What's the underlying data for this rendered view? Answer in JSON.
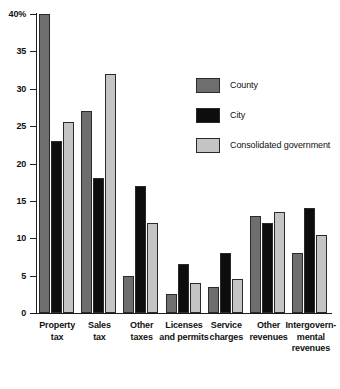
{
  "chart_data": {
    "type": "bar",
    "title": "",
    "subtitle": "",
    "xlabel": "",
    "ylabel": "",
    "ylim": [
      0,
      40
    ],
    "grid": false,
    "legend_position": "upper-right-inside",
    "y_ticks": [
      "0",
      "5",
      "10",
      "15",
      "20",
      "25",
      "30",
      "35",
      "40%"
    ],
    "y_tick_values": [
      0,
      5,
      10,
      15,
      20,
      25,
      30,
      35,
      40
    ],
    "categories": [
      "Property tax",
      "Sales tax",
      "Other taxes",
      "Licenses and permits",
      "Service charges",
      "Other revenues",
      "Intergovernmental revenues"
    ],
    "category_labels": [
      [
        "Property",
        "tax"
      ],
      [
        "Sales",
        "tax"
      ],
      [
        "Other",
        "taxes"
      ],
      [
        "Licenses",
        "and permits"
      ],
      [
        "Service",
        "charges"
      ],
      [
        "Other",
        "revenues"
      ],
      [
        "Intergovern-",
        "mental",
        "revenues"
      ]
    ],
    "series": [
      {
        "name": "County",
        "color": "#6e6e6e",
        "values": [
          40,
          27,
          5,
          2.5,
          3.5,
          13,
          8
        ]
      },
      {
        "name": "City",
        "color": "#0d0d0d",
        "values": [
          23,
          18,
          17,
          6.5,
          8,
          12,
          14
        ]
      },
      {
        "name": "Consolidated government",
        "color": "#c4c4c4",
        "values": [
          25.5,
          32,
          12,
          4,
          4.5,
          13.5,
          10.5
        ]
      }
    ]
  },
  "legend": {
    "items": [
      {
        "label": "County",
        "color": "#6e6e6e"
      },
      {
        "label": "City",
        "color": "#0d0d0d"
      },
      {
        "label": "Consolidated government",
        "color": "#c4c4c4"
      }
    ]
  }
}
